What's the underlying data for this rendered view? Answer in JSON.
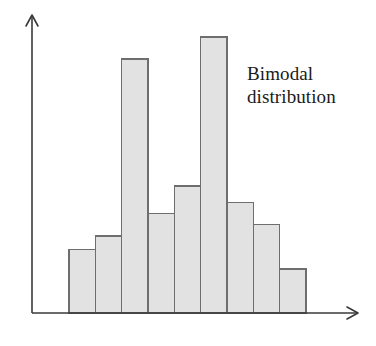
{
  "figure": {
    "name": "bimodal-distribution-histogram",
    "width": 376,
    "height": 346,
    "background_color": "#ffffff"
  },
  "annotation": {
    "line1": "Bimodal",
    "line2": "distribution",
    "full_text": "Bimodal distribution",
    "color": "#1a1a1a",
    "x": 247,
    "y": 62
  },
  "axes": {
    "y_axis": {
      "name": "y-axis",
      "x": 32,
      "top_y": 15,
      "bottom_y": 313,
      "has_arrow_head": true,
      "color": "#3a3a3a",
      "tick_labels": [],
      "label": ""
    },
    "x_axis": {
      "name": "x-axis",
      "y": 313,
      "left_x": 32,
      "right_x": 358,
      "has_arrow_head": true,
      "color": "#3a3a3a",
      "tick_labels": [],
      "label": ""
    }
  },
  "style": {
    "bar_fill": "#e2e2e2",
    "bar_stroke": "#6e6e6e",
    "bar_stroke_width": 1.6,
    "axis_color": "#3a3a3a",
    "axis_width": 1.6
  },
  "chart_data": {
    "type": "bar",
    "title": "",
    "subtitle": "",
    "xlabel": "",
    "ylabel": "",
    "categories": [
      "1",
      "2",
      "3",
      "4",
      "5",
      "6",
      "7",
      "8",
      "9"
    ],
    "values": [
      23,
      28,
      92,
      36,
      46,
      100,
      40,
      32,
      16
    ],
    "ylim": [
      0,
      100
    ],
    "xlim": [
      0,
      9
    ],
    "grid": false,
    "legend": null,
    "annotations": [
      "Bimodal distribution"
    ],
    "bar_geometry": {
      "plot_left_x": 69,
      "plot_right_x": 306,
      "baseline_y": 313,
      "bar_width": 26.3,
      "bar_top_y": [
        249,
        236,
        58,
        213,
        187,
        37,
        202,
        226,
        268
      ]
    }
  }
}
